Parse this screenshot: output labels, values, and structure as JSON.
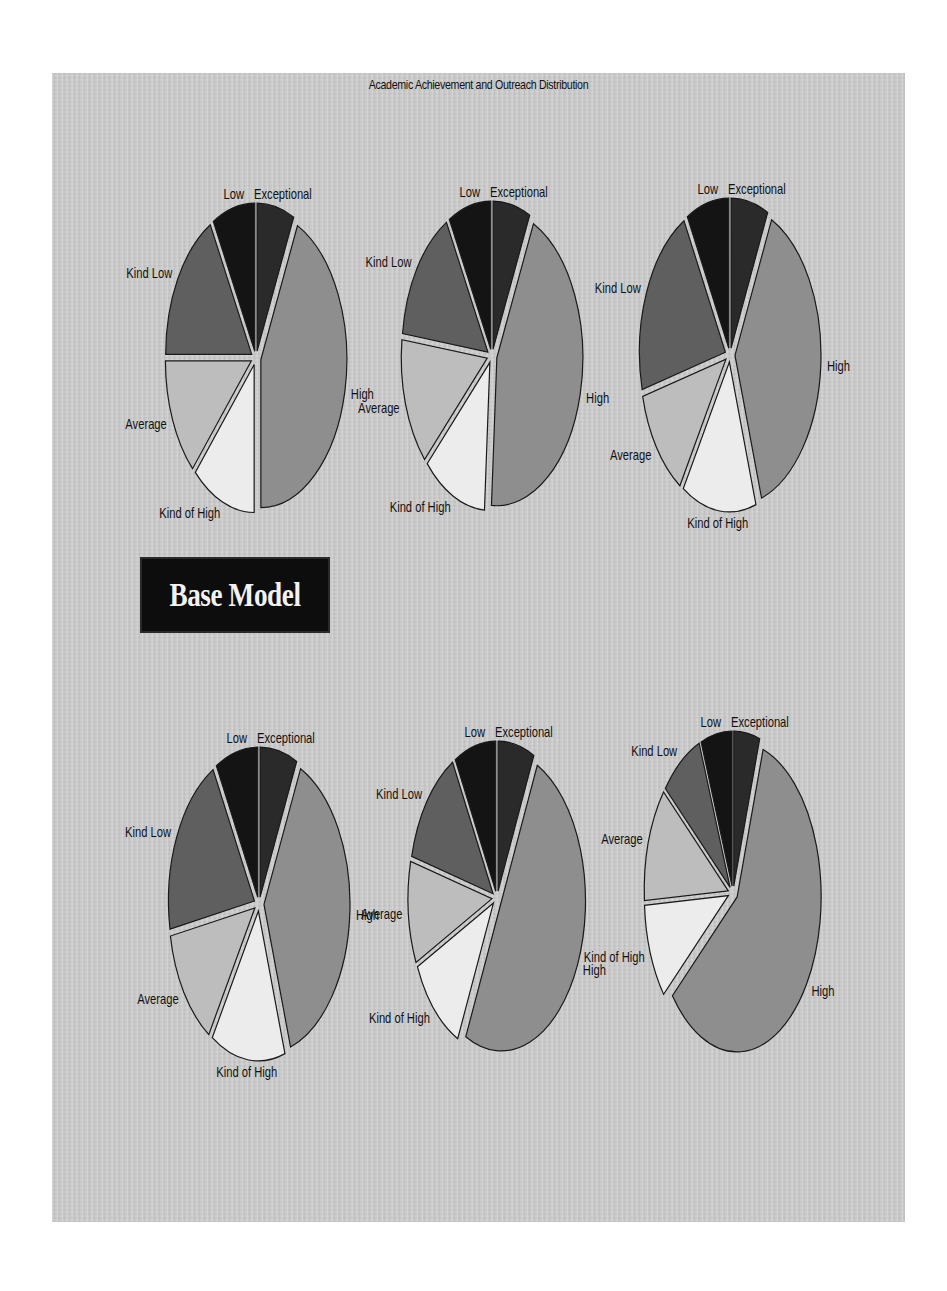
{
  "title": "Academic Achievement and Outreach Distribution",
  "badge": {
    "label": "Base Model"
  },
  "colors": {
    "Exceptional": "#2a2a2a",
    "High": "#8e8e8e",
    "Kind of High": "#ececec",
    "Average": "#bdbdbd",
    "Kind Low": "#5f5f5f",
    "Low": "#141414",
    "outline": "#1a1a1a",
    "background": "#c9c9c9",
    "badge_bg": "#0d0d0d",
    "badge_text": "#f2f2f2"
  },
  "chart_data": [
    {
      "type": "pie",
      "id": "top-left",
      "title": "",
      "categories": [
        "Exceptional",
        "High",
        "Kind of High",
        "Average",
        "Kind Low",
        "Low"
      ],
      "values": [
        7,
        43,
        12,
        13,
        17,
        8
      ],
      "start_angle": "12 o'clock, clockwise",
      "exploded": true
    },
    {
      "type": "pie",
      "id": "top-middle",
      "title": "",
      "categories": [
        "Exceptional",
        "High",
        "Kind of High",
        "Average",
        "Kind Low",
        "Low"
      ],
      "values": [
        7,
        44,
        12,
        14,
        15,
        8
      ],
      "start_angle": "12 o'clock, clockwise",
      "exploded": true
    },
    {
      "type": "pie",
      "id": "top-right",
      "title": "",
      "categories": [
        "Exceptional",
        "High",
        "Kind of High",
        "Average",
        "Kind Low",
        "Low"
      ],
      "values": [
        7,
        38,
        14,
        12,
        21,
        8
      ],
      "start_angle": "12 o'clock, clockwise",
      "exploded": true
    },
    {
      "type": "pie",
      "id": "bottom-left",
      "title": "",
      "categories": [
        "Exceptional",
        "High",
        "Kind of High",
        "Average",
        "Kind Low",
        "Low"
      ],
      "values": [
        7,
        38,
        14,
        13,
        20,
        8
      ],
      "start_angle": "12 o'clock, clockwise",
      "exploded": true
    },
    {
      "type": "pie",
      "id": "bottom-middle",
      "title": "",
      "categories": [
        "Exceptional",
        "High",
        "Kind of High",
        "Average",
        "Kind Low",
        "Low"
      ],
      "values": [
        7,
        50,
        11,
        11,
        13,
        8
      ],
      "start_angle": "12 o'clock, clockwise",
      "exploded": true
    },
    {
      "type": "pie",
      "id": "bottom-right",
      "title": "",
      "categories": [
        "Exceptional",
        "High",
        "Kind of High",
        "Average",
        "Kind Low",
        "Low"
      ],
      "values": [
        5,
        59,
        10,
        12,
        8,
        6
      ],
      "start_angle": "12 o'clock, clockwise",
      "exploded": true
    }
  ],
  "layout": [
    {
      "cx": 256,
      "cy": 358,
      "rx": 86,
      "ry": 148
    },
    {
      "cx": 492,
      "cy": 356,
      "rx": 86,
      "ry": 148
    },
    {
      "cx": 730,
      "cy": 355,
      "rx": 86,
      "ry": 150
    },
    {
      "cx": 259,
      "cy": 904,
      "rx": 86,
      "ry": 150
    },
    {
      "cx": 497,
      "cy": 898,
      "rx": 84,
      "ry": 150
    },
    {
      "cx": 733,
      "cy": 893,
      "rx": 84,
      "ry": 155
    }
  ]
}
